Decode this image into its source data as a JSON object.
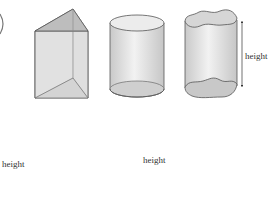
{
  "diagram": {
    "title": "",
    "part_marker": ")",
    "shapes": [
      {
        "name": "triangular-prism",
        "label": ""
      },
      {
        "name": "right-cylinder",
        "label": ""
      },
      {
        "name": "wavy-cylinder",
        "label": "height"
      },
      {
        "name": "oblique-prism",
        "label": "height"
      },
      {
        "name": "oblique-cylinder",
        "label": "height"
      }
    ],
    "colors": {
      "stroke": "#555555",
      "fill_light": "#e6e6e6",
      "fill_mid": "#d2d2d2",
      "fill_dark": "#bdbdbd"
    }
  }
}
